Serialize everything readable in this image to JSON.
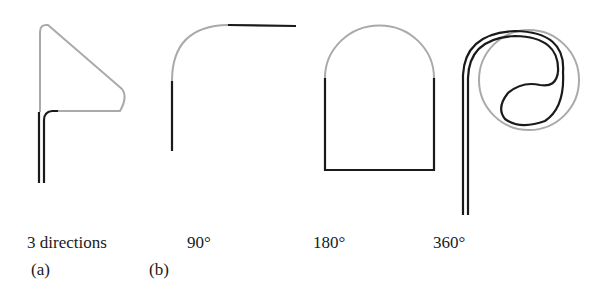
{
  "colors": {
    "dark": "#1a1a1a",
    "gray": "#aaaaaa",
    "background": "#ffffff"
  },
  "panels": [
    {
      "id": "a",
      "caption": "3 directions",
      "tag": "(a)"
    },
    {
      "id": "b1",
      "caption": "90°",
      "tag": "(b)"
    },
    {
      "id": "b2",
      "caption": "180°"
    },
    {
      "id": "b3",
      "caption": "360°"
    }
  ]
}
